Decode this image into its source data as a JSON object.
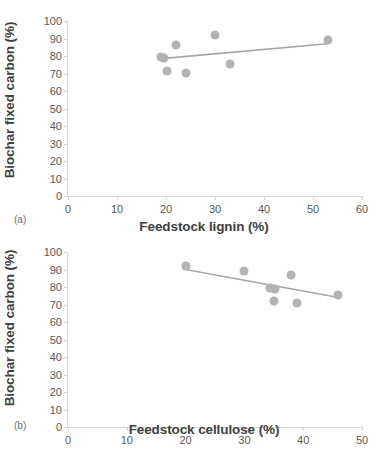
{
  "figure": {
    "panel_a_label": "(a)",
    "panel_b_label": "(b)",
    "marker_color": "#b3b3b3",
    "trendline_color": "#a6a6a6",
    "axis_color": "#d4d4d4",
    "text_color": "#3f3f3f"
  },
  "chart_data": [
    {
      "type": "scatter",
      "panel": "(a)",
      "title": "",
      "xlabel": "Feedstock lignin (%)",
      "ylabel": "Biochar fixed carbon (%)",
      "xlim": [
        0,
        60
      ],
      "ylim": [
        0,
        100
      ],
      "xticks": [
        0,
        10,
        20,
        30,
        40,
        50,
        60
      ],
      "yticks": [
        0,
        10,
        20,
        30,
        40,
        50,
        60,
        70,
        80,
        90,
        100
      ],
      "grid": false,
      "legend": "none",
      "points": [
        {
          "x": 19.0,
          "y": 79.5
        },
        {
          "x": 19.6,
          "y": 79.0
        },
        {
          "x": 22.0,
          "y": 86.5
        },
        {
          "x": 20.2,
          "y": 71.5
        },
        {
          "x": 24.0,
          "y": 70.5
        },
        {
          "x": 30.0,
          "y": 92.0
        },
        {
          "x": 33.0,
          "y": 75.5
        },
        {
          "x": 53.0,
          "y": 89.0
        }
      ],
      "trendline": {
        "x0": 19.0,
        "y0": 78.5,
        "x1": 53.0,
        "y1": 87.0,
        "slope": "positive"
      }
    },
    {
      "type": "scatter",
      "panel": "(b)",
      "title": "",
      "xlabel": "Feedstock cellulose (%)",
      "ylabel": "Biochar fixed carbon (%)",
      "xlim": [
        0,
        50
      ],
      "ylim": [
        0,
        100
      ],
      "xticks": [
        0,
        10,
        20,
        30,
        40,
        50
      ],
      "yticks": [
        0,
        10,
        20,
        30,
        40,
        50,
        60,
        70,
        80,
        90,
        100
      ],
      "grid": false,
      "legend": "none",
      "points": [
        {
          "x": 20.0,
          "y": 92.0
        },
        {
          "x": 30.0,
          "y": 89.0
        },
        {
          "x": 34.4,
          "y": 79.5
        },
        {
          "x": 35.2,
          "y": 79.0
        },
        {
          "x": 38.0,
          "y": 87.0
        },
        {
          "x": 35.0,
          "y": 72.0
        },
        {
          "x": 39.0,
          "y": 71.0
        },
        {
          "x": 46.0,
          "y": 75.5
        }
      ],
      "trendline": {
        "x0": 20.0,
        "y0": 90.0,
        "x1": 46.0,
        "y1": 74.0,
        "slope": "negative"
      }
    }
  ]
}
